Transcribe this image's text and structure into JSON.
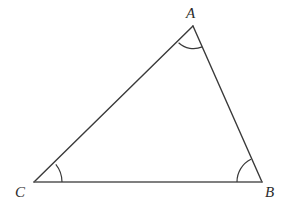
{
  "figure": {
    "background_color": "#ffffff",
    "stroke_color": "#3a3a3a",
    "side_stroke_color": "#555555",
    "arc_stroke_color": "#3a3a3a",
    "stroke_width": 1.4,
    "arc_stroke_width": 1.2,
    "canvas": {
      "width": 288,
      "height": 212
    }
  },
  "vertices": [
    {
      "name": "A",
      "label": "A",
      "x": 193,
      "y": 26,
      "label_x": 186,
      "label_y": 6
    },
    {
      "name": "B",
      "label": "B",
      "x": 262,
      "y": 182,
      "label_x": 265,
      "label_y": 185
    },
    {
      "name": "C",
      "label": "C",
      "x": 34,
      "y": 182,
      "label_x": 15,
      "label_y": 185
    }
  ],
  "sides": [
    {
      "name": "CA",
      "from": "C",
      "to": "A",
      "x1": 34,
      "y1": 182,
      "x2": 193,
      "y2": 26
    },
    {
      "name": "AB",
      "from": "A",
      "to": "B",
      "x1": 193,
      "y1": 26,
      "x2": 262,
      "y2": 182
    },
    {
      "name": "CB",
      "from": "C",
      "to": "B",
      "x1": 34,
      "y1": 182,
      "x2": 262,
      "y2": 182
    }
  ],
  "angle_arcs": [
    {
      "name": "angle-arc-A",
      "vertex": "A",
      "radius": 22,
      "path": "M 178.6 42.8 A 22 22 0 0 0 202.2 46.9"
    },
    {
      "name": "angle-arc-B",
      "vertex": "B",
      "radius": 25,
      "path": "M 237 182 A 25 25 0 0 1 251.0 159.3"
    },
    {
      "name": "angle-arc-C",
      "vertex": "C",
      "radius": 28,
      "path": "M 62 182 A 28 28 0 0 0 55.8 164.3"
    }
  ]
}
